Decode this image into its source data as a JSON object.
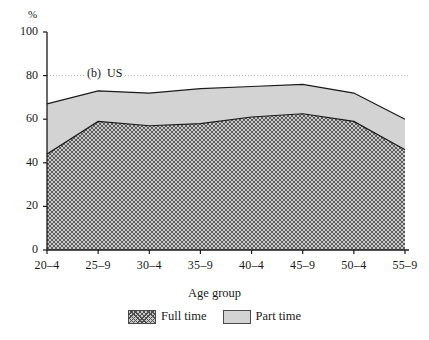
{
  "figure": {
    "panel_label": "(b)  US",
    "y_unit": "%",
    "x_axis_title": "Age group"
  },
  "legend": {
    "items": [
      {
        "label": "Full time",
        "swatch": "hatched-swatch"
      },
      {
        "label": "Part time",
        "swatch": "solid-gray-swatch"
      }
    ]
  },
  "colors": {
    "axis": "#1a1a1a",
    "part_time_fill": "#d3d3d3",
    "full_time_fill": "#c9c9c9",
    "hatch_stroke": "#4f4f4f",
    "gridline": "#9a9a9a"
  },
  "chart_data": {
    "type": "area",
    "title": "(b)  US",
    "xlabel": "Age group",
    "ylabel": "%",
    "ylim": [
      0,
      100
    ],
    "yticks": [
      0,
      20,
      40,
      60,
      80,
      100
    ],
    "grid": "dotted horizontal line at 80",
    "legend_position": "below-axis-centre",
    "stacked": true,
    "categories": [
      "20–4",
      "25–9",
      "30–4",
      "35–9",
      "40–4",
      "45–9",
      "50–4",
      "55–9"
    ],
    "series": [
      {
        "name": "Full time",
        "values": [
          44,
          59,
          57,
          58,
          61,
          62.5,
          59,
          46
        ]
      },
      {
        "name": "Part time",
        "values": [
          23,
          14,
          15,
          16,
          14,
          13.5,
          13,
          14
        ]
      }
    ],
    "cumulative_total": [
      67,
      73,
      72,
      74,
      75,
      76,
      72,
      60
    ]
  }
}
